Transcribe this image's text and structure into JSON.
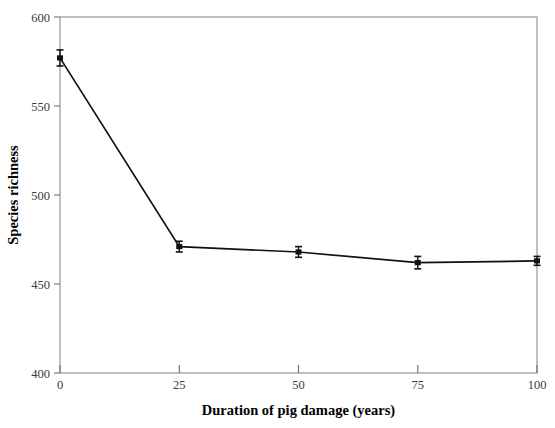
{
  "chart_data": {
    "type": "line",
    "title": "",
    "xlabel": "Duration of pig damage (years)",
    "ylabel": "Species richness",
    "x": [
      0,
      25,
      50,
      75,
      100
    ],
    "values": [
      577,
      471,
      468,
      462,
      463
    ],
    "errors": [
      4.5,
      3.0,
      3.0,
      3.5,
      2.5
    ],
    "xlim": [
      0,
      100
    ],
    "ylim": [
      400,
      600
    ],
    "xticks": [
      0,
      25,
      50,
      75,
      100
    ],
    "yticks": [
      400,
      450,
      500,
      550,
      600
    ],
    "xtick_labels": [
      "0",
      "25",
      "50",
      "75",
      "100"
    ],
    "ytick_labels": [
      "400",
      "450",
      "500",
      "550",
      "600"
    ],
    "grid": false,
    "legend": null,
    "marker": "filled-square",
    "line_color": "#111111",
    "frame_color": "#8d8d8d",
    "background": "#ffffff"
  },
  "axes": {
    "y_title": "Species richness",
    "x_title": "Duration of pig damage (years)",
    "y_ticks": [
      {
        "label": "600",
        "value": 600
      },
      {
        "label": "550",
        "value": 550
      },
      {
        "label": "500",
        "value": 500
      },
      {
        "label": "450",
        "value": 450
      },
      {
        "label": "400",
        "value": 400
      }
    ],
    "x_ticks": [
      {
        "label": "0",
        "value": 0
      },
      {
        "label": "25",
        "value": 25
      },
      {
        "label": "50",
        "value": 50
      },
      {
        "label": "75",
        "value": 75
      },
      {
        "label": "100",
        "value": 100
      }
    ]
  }
}
